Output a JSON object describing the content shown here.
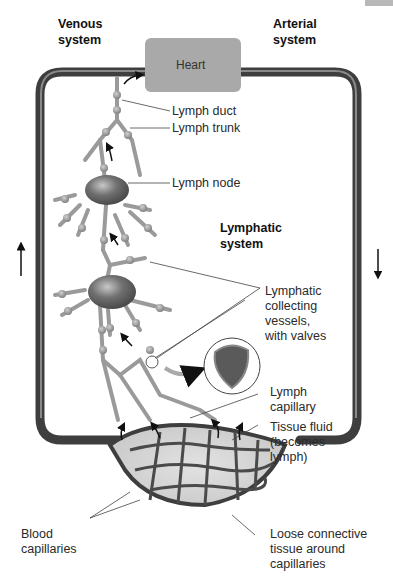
{
  "title_labels": {
    "venous": "Venous\nsystem",
    "arterial": "Arterial\nsystem",
    "lymphatic": "Lymphatic\nsystem"
  },
  "heart_label": "Heart",
  "labels": {
    "lymph_duct": "Lymph duct",
    "lymph_trunk": "Lymph trunk",
    "lymph_node": "Lymph node",
    "collecting_vessels": "Lymphatic\ncollecting\nvessels,\nwith valves",
    "lymph_capillary": "Lymph\ncapillary",
    "tissue_fluid": "Tissue fluid\n(becomes\nlymph)",
    "blood_capillaries": "Blood\ncapillaries",
    "loose_connective": "Loose connective\ntissue around\ncapillaries"
  },
  "colors": {
    "vessel": "#4a4a4a",
    "heart": "#a9a9a9",
    "lymph": "#9a9a9a",
    "node": "#6e6e6e"
  },
  "flow_arrows": {
    "left": "up",
    "right": "down"
  }
}
